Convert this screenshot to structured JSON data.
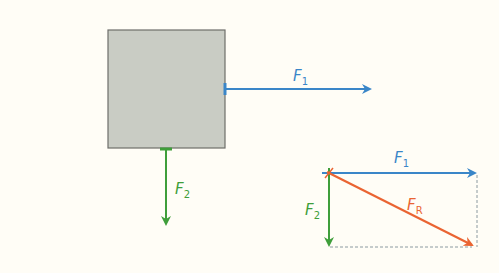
{
  "diagram": {
    "colors": {
      "background": "#fffdf6",
      "block_fill": "#c9ccc4",
      "block_stroke": "#6e6e6a",
      "f1": "#3a86c8",
      "f2": "#3f9e3a",
      "fr": "#ea6432",
      "dashed": "#8c9aa0"
    },
    "block": {
      "x": 108,
      "y": 30,
      "width": 117,
      "height": 118
    },
    "free_body": {
      "f1": {
        "label": "F",
        "sub": "1",
        "x1": 225,
        "y1": 89,
        "x2": 372,
        "y2": 89,
        "label_x": 293,
        "label_y": 81
      },
      "f2": {
        "label": "F",
        "sub": "2",
        "x1": 166,
        "y1": 148,
        "x2": 166,
        "y2": 226,
        "label_x": 175,
        "label_y": 194
      }
    },
    "resultant": {
      "origin": {
        "x": 329,
        "y": 173
      },
      "f1": {
        "label": "F",
        "sub": "1",
        "x2": 477,
        "y2": 173,
        "label_x": 394,
        "label_y": 163
      },
      "f2": {
        "label": "F",
        "sub": "2",
        "x2": 329,
        "y2": 247,
        "label_x": 305,
        "label_y": 215
      },
      "fr": {
        "label": "F",
        "sub": "R",
        "x2": 474,
        "y2": 246,
        "label_x": 407,
        "label_y": 210
      }
    }
  }
}
